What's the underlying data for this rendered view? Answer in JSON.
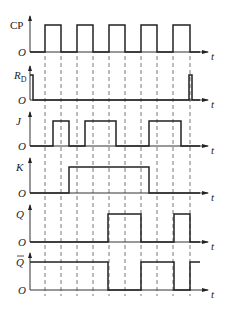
{
  "diagram": {
    "time_label": "t",
    "origin_label": "O",
    "colors": {
      "line": "#222222",
      "background": "#ffffff",
      "dashed": "#555555"
    },
    "clock_edges_x": [
      45,
      61,
      77,
      93,
      109,
      125,
      141,
      157,
      173,
      190
    ],
    "signals": [
      {
        "name": "CP",
        "label": "CP",
        "italic": false,
        "baseline_y": 52,
        "high_y": 25,
        "transitions": [
          [
            30,
            0
          ],
          [
            45,
            1
          ],
          [
            61,
            0
          ],
          [
            77,
            1
          ],
          [
            93,
            0
          ],
          [
            109,
            1
          ],
          [
            125,
            0
          ],
          [
            141,
            1
          ],
          [
            157,
            0
          ],
          [
            173,
            1
          ],
          [
            190,
            0
          ],
          [
            200,
            0
          ]
        ]
      },
      {
        "name": "RD",
        "label": "R",
        "subscript": "D",
        "italic": true,
        "baseline_y": 100,
        "high_y": 75,
        "transitions": [
          [
            30,
            1
          ],
          [
            33,
            0
          ],
          [
            189,
            0
          ],
          [
            189,
            1
          ],
          [
            192,
            0
          ],
          [
            200,
            0
          ]
        ]
      },
      {
        "name": "J",
        "label": "J",
        "italic": true,
        "baseline_y": 146,
        "high_y": 121,
        "transitions": [
          [
            30,
            0
          ],
          [
            53,
            1
          ],
          [
            69,
            0
          ],
          [
            85,
            1
          ],
          [
            116,
            0
          ],
          [
            149,
            1
          ],
          [
            181,
            0
          ],
          [
            200,
            0
          ]
        ]
      },
      {
        "name": "K",
        "label": "K",
        "italic": true,
        "baseline_y": 193,
        "high_y": 167,
        "transitions": [
          [
            30,
            0
          ],
          [
            69,
            1
          ],
          [
            149,
            0
          ],
          [
            200,
            0
          ]
        ]
      },
      {
        "name": "Q",
        "label": "Q",
        "italic": true,
        "baseline_y": 242,
        "high_y": 214,
        "transitions": [
          [
            30,
            0
          ],
          [
            108,
            1
          ],
          [
            141,
            0
          ],
          [
            174,
            1
          ],
          [
            190,
            0
          ],
          [
            200,
            0
          ]
        ]
      },
      {
        "name": "Qbar",
        "label": "Q",
        "overbar": true,
        "italic": true,
        "baseline_y": 290,
        "high_y": 262,
        "transitions": [
          [
            30,
            1
          ],
          [
            108,
            0
          ],
          [
            141,
            1
          ],
          [
            174,
            0
          ],
          [
            190,
            1
          ],
          [
            200,
            1
          ]
        ]
      }
    ]
  }
}
